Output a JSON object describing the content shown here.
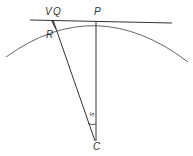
{
  "diagram": {
    "labels": {
      "v": "V",
      "q": "Q",
      "p": "P",
      "r": "R",
      "c": "C",
      "angle": "s"
    },
    "stroke_color": "#333333"
  }
}
